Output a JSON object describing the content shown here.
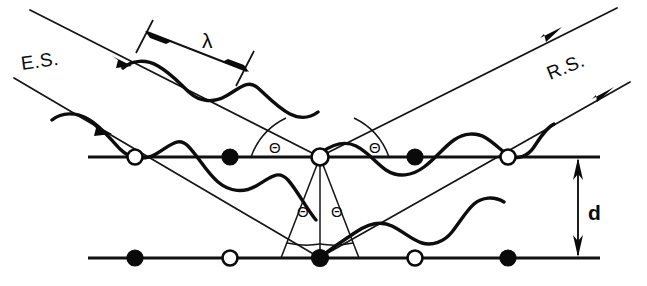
{
  "figure": {
    "background_color": "#ffffff",
    "ink_color": "#0a0a0a",
    "width": 647,
    "height": 286
  },
  "labels": {
    "incident_beam": "E.S.",
    "reflected_beam": "R.S.",
    "wavelength": "λ",
    "interplanar_spacing": "d",
    "angle": "Θ"
  },
  "angles": [
    {
      "id": "theta-upper-left",
      "text": "Θ",
      "x": 272,
      "y": 150
    },
    {
      "id": "theta-upper-right",
      "text": "Θ",
      "x": 372,
      "y": 150
    },
    {
      "id": "theta-lower-left",
      "text": "Θ",
      "x": 300,
      "y": 214
    },
    {
      "id": "theta-lower-right",
      "text": "Θ",
      "x": 335,
      "y": 214
    }
  ],
  "lattice": {
    "plane_spacing_label": "d",
    "top_plane": {
      "y": 157,
      "x_start": 88,
      "x_end": 600,
      "atoms": [
        {
          "x": 135,
          "type": "open"
        },
        {
          "x": 230,
          "type": "filled"
        },
        {
          "x": 320,
          "type": "open"
        },
        {
          "x": 415,
          "type": "filled"
        },
        {
          "x": 508,
          "type": "open"
        }
      ]
    },
    "bottom_plane": {
      "y": 258,
      "x_start": 88,
      "x_end": 600,
      "atoms": [
        {
          "x": 135,
          "type": "filled"
        },
        {
          "x": 230,
          "type": "open"
        },
        {
          "x": 320,
          "type": "filled"
        },
        {
          "x": 415,
          "type": "open"
        },
        {
          "x": 508,
          "type": "filled"
        }
      ]
    }
  },
  "beams": {
    "incident": [
      {
        "id": "incident-upper",
        "from": [
          30,
          10
        ],
        "to": [
          320,
          157
        ],
        "has_wave": true,
        "arrow_at": 0.33
      },
      {
        "id": "incident-lower",
        "from": [
          14,
          78
        ],
        "to": [
          320,
          258
        ],
        "has_wave": true,
        "arrow_at": 0.28
      }
    ],
    "reflected": [
      {
        "id": "reflected-upper",
        "from": [
          320,
          157
        ],
        "to": [
          617,
          8
        ],
        "has_wave": true,
        "arrow_at": 0.8
      },
      {
        "id": "reflected-lower",
        "from": [
          320,
          258
        ],
        "to": [
          630,
          82
        ],
        "has_wave": true,
        "arrow_at": 0.82
      }
    ]
  },
  "dimensions": {
    "wavelength_marker": {
      "label": "λ",
      "start": [
        160,
        28
      ],
      "end": [
        243,
        70
      ],
      "label_x": 207,
      "label_y": 46
    },
    "spacing_marker": {
      "label": "d",
      "x": 578,
      "y_top": 157,
      "y_bottom": 258,
      "label_x": 592,
      "label_y": 214
    }
  }
}
